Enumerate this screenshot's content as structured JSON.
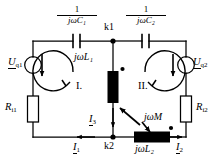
{
  "diagram": {
    "ink_color": "#000000",
    "background": "#ffffff"
  },
  "components": {
    "cap1": {
      "name": "capacitor-c1",
      "label_num": "1",
      "label_den": "jωC₁"
    },
    "cap2": {
      "name": "capacitor-c2",
      "label_num": "1",
      "label_den": "jωC₂"
    },
    "source1": {
      "name": "voltage-source-left",
      "label_main": "U",
      "label_sub": "q1"
    },
    "source2": {
      "name": "voltage-source-right",
      "label_main": "U",
      "label_sub": "q2"
    },
    "res1": {
      "name": "resistor-ri1",
      "label_main": "R",
      "label_sub": "i1"
    },
    "res2": {
      "name": "resistor-ri2",
      "label_main": "R",
      "label_sub": "i2"
    },
    "ind1": {
      "name": "inductor-l1",
      "label": "jωL₁"
    },
    "ind2": {
      "name": "inductor-l2",
      "label": "jωL₂"
    },
    "mutual": {
      "name": "mutual-inductance",
      "label": "jωM"
    }
  },
  "nodes": {
    "k1": "k1",
    "k2": "k2"
  },
  "currents": {
    "i1": {
      "main": "I",
      "sub": "1"
    },
    "i2": {
      "main": "I",
      "sub": "2"
    },
    "i3": {
      "main": "I",
      "sub": "3"
    }
  },
  "meshes": {
    "left": "I.",
    "right": "II."
  }
}
